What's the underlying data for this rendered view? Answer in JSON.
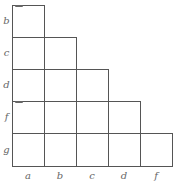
{
  "chart_title": "Implication chart (staircase grid)",
  "row_labels": [
    "b",
    "c",
    "d",
    "f",
    "g"
  ],
  "column_labels": [
    "a",
    "b",
    "c",
    "d",
    "f"
  ],
  "cells": [
    {
      "row": "b",
      "cols": [
        "a"
      ]
    },
    {
      "row": "c",
      "cols": [
        "a",
        "b"
      ]
    },
    {
      "row": "d",
      "cols": [
        "a",
        "b",
        "c"
      ]
    },
    {
      "row": "f",
      "cols": [
        "a",
        "b",
        "c",
        "d"
      ]
    },
    {
      "row": "g",
      "cols": [
        "a",
        "b",
        "c",
        "d",
        "f"
      ]
    }
  ],
  "colors": {
    "grid_line": "#555555",
    "label": "#666666"
  }
}
